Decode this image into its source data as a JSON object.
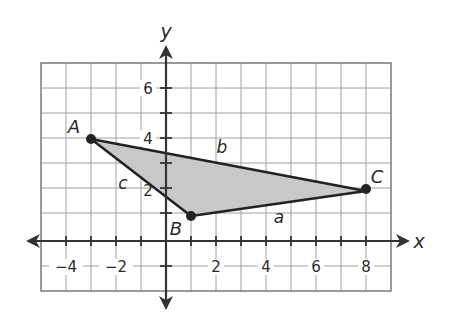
{
  "figure": {
    "type": "coordinate-plane-triangle",
    "axes": {
      "x_label": "x",
      "y_label": "y",
      "x_range": [
        -5,
        9
      ],
      "y_range": [
        -2,
        7
      ],
      "grid": true,
      "x_tick_labels": [
        "−4",
        "−2",
        "2",
        "4",
        "6",
        "8"
      ],
      "y_tick_labels": [
        "6",
        "4",
        "2"
      ]
    },
    "vertices": [
      {
        "name": "A",
        "x": -3,
        "y": 4
      },
      {
        "name": "B",
        "x": 1,
        "y": 1
      },
      {
        "name": "C",
        "x": 8,
        "y": 2
      }
    ],
    "sides": [
      {
        "name": "a",
        "from": "B",
        "to": "C"
      },
      {
        "name": "b",
        "from": "A",
        "to": "C"
      },
      {
        "name": "c",
        "from": "A",
        "to": "B"
      }
    ],
    "fill_color": "#c8c8c8",
    "line_color": "#222222",
    "grid_color": "#9a9a9a"
  }
}
